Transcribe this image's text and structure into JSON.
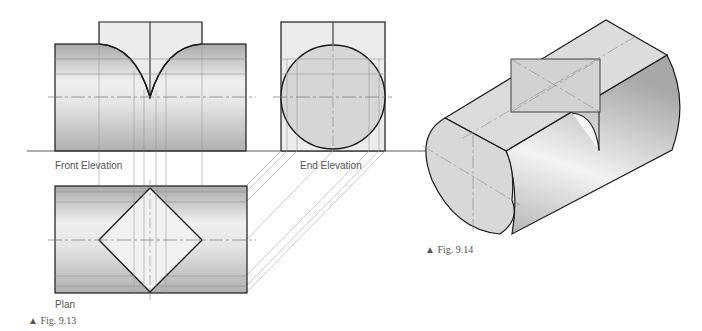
{
  "labels": {
    "front_elevation": "Front Elevation",
    "end_elevation": "End Elevation",
    "plan": "Plan"
  },
  "captions": {
    "fig_913": "▲ Fig. 9.13",
    "fig_914": "▲ Fig. 9.14"
  },
  "colors": {
    "outline": "#1a1a1a",
    "construction": "#9a9a9a",
    "prism_fill": "#ececec",
    "cylinder_dark": "#b8b8b8",
    "cylinder_light": "#f2f2f2"
  }
}
